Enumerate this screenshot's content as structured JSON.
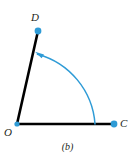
{
  "figure": {
    "caption": "(b)",
    "background_color": "#ffffff",
    "ray_color": "#000000",
    "arc_color": "#2e9bd6",
    "point_color": "#2e9bd6",
    "label_color": "#231f20",
    "labels": {
      "vertex": "O",
      "terminal_side": "D",
      "initial_side": "C"
    },
    "points": [
      {
        "name": "O",
        "label": "O",
        "x": 17,
        "y": 124,
        "radius": 2.6
      },
      {
        "name": "D",
        "label": "D",
        "x": 38,
        "y": 31,
        "radius": 3.4
      },
      {
        "name": "C",
        "label": "C",
        "x": 114,
        "y": 124,
        "radius": 3.4
      }
    ],
    "rays": [
      {
        "name": "ray-OD",
        "from": "O",
        "to": "D",
        "x1": 17,
        "y1": 124,
        "x2": 38,
        "y2": 31
      },
      {
        "name": "ray-OC",
        "from": "O",
        "to": "C",
        "x1": 17,
        "y1": 124,
        "x2": 114,
        "y2": 124
      }
    ],
    "arc": {
      "name": "rotation-arc",
      "center_x": 17,
      "center_y": 124,
      "radius": 78,
      "start_x": 95,
      "start_y": 124,
      "end_x": 37,
      "end_y": 54,
      "direction": "counterclockwise",
      "arrow_at": "end",
      "arrow_tip_x": 35,
      "arrow_tip_y": 52
    }
  }
}
